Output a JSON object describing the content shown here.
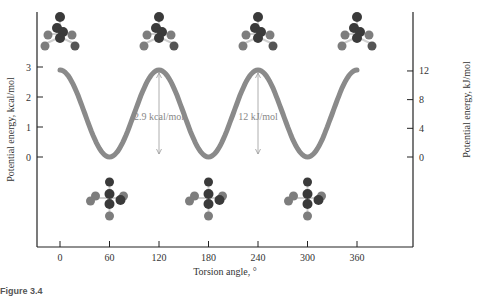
{
  "chart_data": {
    "type": "line",
    "title": "",
    "xlabel": "Torsion angle, °",
    "ylabel_left": "Potential energy, kcal/mol",
    "ylabel_right": "Potential energy, kJ/mol",
    "x_ticks": [
      0,
      60,
      120,
      180,
      240,
      300,
      360
    ],
    "y_left_ticks": [
      0,
      1,
      2,
      3
    ],
    "y_right_ticks": [
      0,
      4,
      8,
      12
    ],
    "xlim": [
      -15,
      380
    ],
    "ylim_left": [
      -3.2,
      3.5
    ],
    "grid": false,
    "series": [
      {
        "name": "Ethane torsional energy",
        "x": [
          0,
          30,
          60,
          90,
          120,
          150,
          180,
          210,
          240,
          270,
          300,
          330,
          360
        ],
        "y": [
          2.9,
          1.45,
          0,
          1.45,
          2.9,
          1.45,
          0,
          1.45,
          2.9,
          1.45,
          0,
          1.45,
          2.9
        ]
      }
    ],
    "annotations": [
      {
        "text": "2.9 kcal/mol",
        "x": 120
      },
      {
        "text": "12 kJ/mol",
        "x": 240
      }
    ],
    "molecule_images": [
      {
        "conformation": "eclipsed",
        "x": 0,
        "position": "top"
      },
      {
        "conformation": "eclipsed",
        "x": 120,
        "position": "top"
      },
      {
        "conformation": "eclipsed",
        "x": 240,
        "position": "top"
      },
      {
        "conformation": "eclipsed",
        "x": 360,
        "position": "top"
      },
      {
        "conformation": "staggered",
        "x": 60,
        "position": "bottom"
      },
      {
        "conformation": "staggered",
        "x": 180,
        "position": "bottom"
      },
      {
        "conformation": "staggered",
        "x": 300,
        "position": "bottom"
      }
    ]
  },
  "labels": {
    "xlabel": "Torsion angle, °",
    "ylabel_left": "Potential energy, kcal/mol",
    "ylabel_right": "Potential energy, kJ/mol",
    "annot_kcal": "2.9 kcal/mol",
    "annot_kj": "12 kJ/mol",
    "caption": "Figure 3.4"
  },
  "colors": {
    "curve": "#8a8a8a",
    "axis": "#222222",
    "carbon": "#3a3a3a",
    "hydrogen": "#7d7d7d"
  }
}
